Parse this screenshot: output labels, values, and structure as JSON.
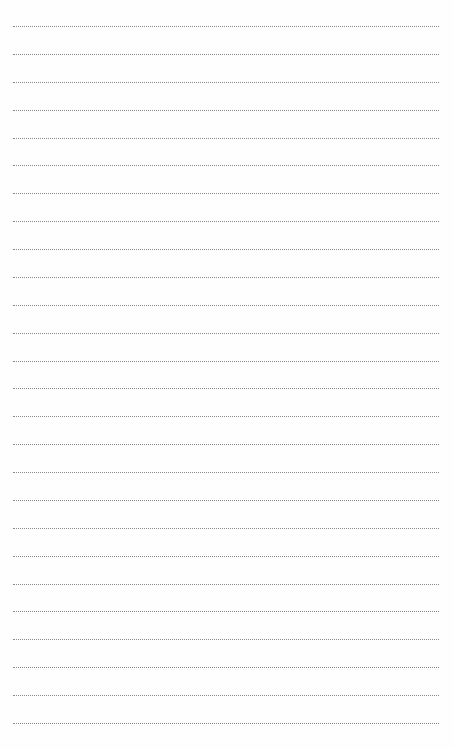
{
  "page": {
    "type": "lined-paper",
    "background_color": "#fefefe",
    "line_color": "#8a8a8a",
    "line_style": "dotted",
    "line_count": 26,
    "first_line_y": 26,
    "line_spacing": 27.88,
    "line_left": 13,
    "line_width": 426
  }
}
